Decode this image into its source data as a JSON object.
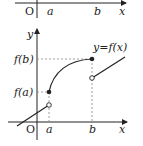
{
  "top_panel": {
    "origin_label": "O",
    "ticks": [
      "a",
      "b"
    ],
    "x_axis_label": "x"
  },
  "graph": {
    "y_axis_label": "y",
    "x_axis_label": "x",
    "origin_label": "O",
    "x_ticks": [
      "a",
      "b"
    ],
    "y_ticks": [
      "f(a)",
      "f(b)"
    ],
    "curve_label": "y=f(x)",
    "points": {
      "filled": [
        "(a, f(a))",
        "(b, f(b))"
      ],
      "open": [
        "left limit at a",
        "right limit at b"
      ]
    }
  },
  "colors": {
    "line": "#222222",
    "guide": "#888888"
  }
}
